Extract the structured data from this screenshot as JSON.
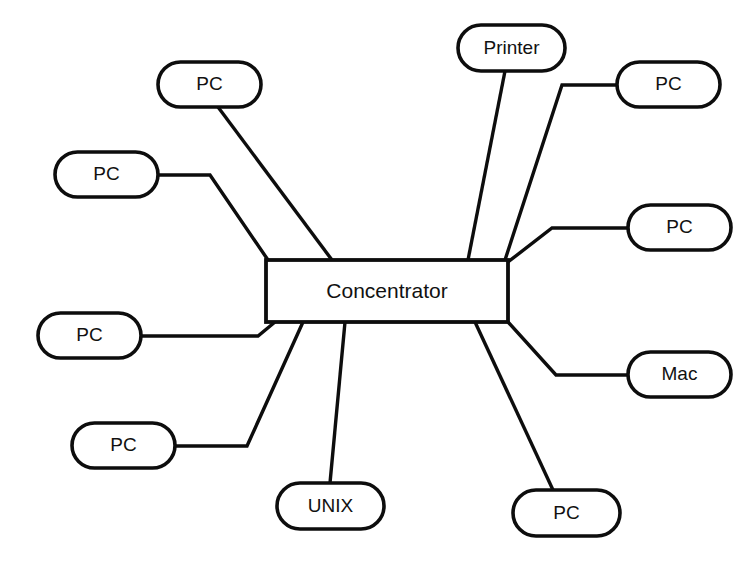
{
  "diagram": {
    "background_color": "#ffffff",
    "line_color": "#0d0d0d",
    "text_color": "#111111",
    "hub": {
      "label": "Concentrator",
      "shape": "rectangle",
      "x": 266,
      "y": 260,
      "width": 242,
      "height": 62
    },
    "nodes": [
      {
        "id": "node-printer",
        "label": "Printer",
        "shape": "rounded-rectangle",
        "x": 458,
        "y": 25,
        "width": 107,
        "height": 46,
        "connector": "M 505,71 L 468,260"
      },
      {
        "id": "node-pc-top-right",
        "label": "PC",
        "shape": "rounded-rectangle",
        "x": 617,
        "y": 62,
        "width": 103,
        "height": 45,
        "connector": "M 617,85 L 562,85 L 505,260"
      },
      {
        "id": "node-pc-top-left",
        "label": "PC",
        "shape": "rounded-rectangle",
        "x": 158,
        "y": 62,
        "width": 103,
        "height": 45,
        "connector": "M 218,107 L 332,260"
      },
      {
        "id": "node-pc-left-upper",
        "label": "PC",
        "shape": "rounded-rectangle",
        "x": 55,
        "y": 152,
        "width": 103,
        "height": 45,
        "connector": "M 158,175 L 210,175 L 268,260"
      },
      {
        "id": "node-pc-right-upper",
        "label": "PC",
        "shape": "rounded-rectangle",
        "x": 628,
        "y": 205,
        "width": 103,
        "height": 45,
        "connector": "M 628,228 L 552,228 L 508,262"
      },
      {
        "id": "node-pc-left-lower",
        "label": "PC",
        "shape": "rounded-rectangle",
        "x": 38,
        "y": 313,
        "width": 103,
        "height": 45,
        "connector": "M 141,336 L 258,336 L 275,322"
      },
      {
        "id": "node-mac",
        "label": "Mac",
        "shape": "rounded-rectangle",
        "x": 628,
        "y": 352,
        "width": 103,
        "height": 45,
        "connector": "M 628,375 L 556,375 L 508,322"
      },
      {
        "id": "node-pc-bottom-left",
        "label": "PC",
        "shape": "rounded-rectangle",
        "x": 72,
        "y": 423,
        "width": 103,
        "height": 45,
        "connector": "M 175,446 L 247,446 L 303,322"
      },
      {
        "id": "node-unix",
        "label": "UNIX",
        "shape": "rounded-rectangle",
        "x": 277,
        "y": 483,
        "width": 107,
        "height": 46,
        "connector": "M 330,483 L 345,322"
      },
      {
        "id": "node-pc-bottom-right",
        "label": "PC",
        "shape": "rounded-rectangle",
        "x": 513,
        "y": 490,
        "width": 107,
        "height": 46,
        "connector": "M 553,490 L 475,322"
      },
      {
        "id": "node-pc-bottom-center",
        "label": "PC",
        "shape": "rounded-rectangle",
        "x": 513,
        "y": 490,
        "width": 0,
        "height": 0,
        "connector": "M 425,425 L 418,322"
      }
    ]
  }
}
